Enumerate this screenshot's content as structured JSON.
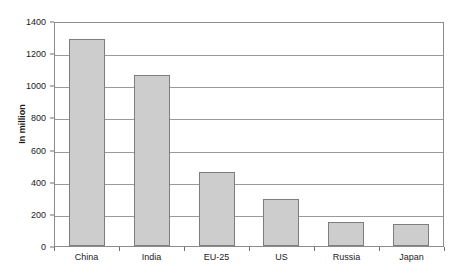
{
  "chart_data": {
    "type": "bar",
    "title": "",
    "subtitle": "",
    "xlabel": "",
    "ylabel": "In million",
    "categories": [
      "China",
      "India",
      "EU-25",
      "US",
      "Russia",
      "Japan"
    ],
    "values": [
      1285,
      1065,
      460,
      293,
      152,
      140
    ],
    "ylim": [
      0,
      1400
    ],
    "yticks": [
      0,
      200,
      400,
      600,
      800,
      1000,
      1200,
      1400
    ],
    "ytick_labels": [
      "0",
      "200",
      "400",
      "600",
      "800",
      "1000",
      "1200",
      "1400"
    ],
    "grid": true,
    "legend": null,
    "legend_position": "none",
    "annotations": [],
    "series": [
      {
        "name": "Population",
        "values": [
          1285,
          1065,
          460,
          293,
          152,
          140
        ]
      }
    ]
  },
  "style": {
    "bar_fill": "#cdcdcd",
    "bar_border": "#7d7d7d",
    "grid_color": "#9a9a9a",
    "axis_color": "#8c8c8c",
    "text_color": "#1a1a1a",
    "background": "#ffffff"
  }
}
